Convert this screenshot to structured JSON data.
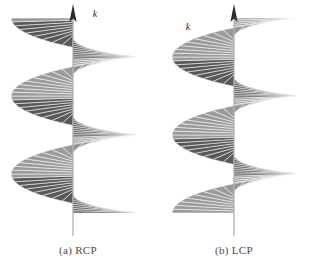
{
  "figure": {
    "background_color": "#ffffff",
    "spoke_color": "#808080",
    "spoke_dark_color": "#4f4f4f",
    "axis_color": "#9a9a9a",
    "arrow_color": "#2b2b2b",
    "caption_color": "#4a4a4a"
  },
  "panels": [
    {
      "id": "rcp",
      "handedness": "right",
      "caption": "(a) RCP",
      "axis_label": "k",
      "axis_label_side": "right",
      "lobe_direction": "left"
    },
    {
      "id": "lcp",
      "handedness": "left",
      "caption": "(b) LCP",
      "axis_label": "k",
      "axis_label_side": "left",
      "lobe_direction": "right"
    }
  ],
  "chart_data": {
    "type": "line",
    "xlabel": "",
    "ylabel": "propagation direction k",
    "grid": false,
    "legend_position": "none",
    "annotations": [
      "k",
      "(a) RCP",
      "(b) LCP"
    ],
    "series": [
      {
        "name": "RCP helix spokes",
        "handedness": "right",
        "turns": 2.5,
        "spokes_per_turn": 36,
        "radius_px": 62,
        "pitch_px": 78,
        "axis_x_px": 73,
        "axis_top_px": 10,
        "axis_bottom_px": 236
      },
      {
        "name": "LCP helix spokes",
        "handedness": "left",
        "turns": 2.5,
        "spokes_per_turn": 36,
        "radius_px": 62,
        "pitch_px": 78,
        "axis_x_px": 234,
        "axis_top_px": 10,
        "axis_bottom_px": 236
      }
    ]
  }
}
